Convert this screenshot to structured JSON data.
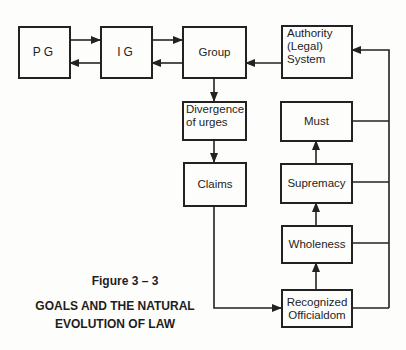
{
  "figure": {
    "label": "Figure 3 – 3",
    "title_line1": "GOALS AND THE NATURAL",
    "title_line2": "EVOLUTION OF LAW"
  },
  "nodes": {
    "pg": "PG",
    "ig": "IG",
    "group": "Group",
    "authority": [
      "Authority",
      "(Legal)",
      "System"
    ],
    "divergence": [
      "Divergence",
      "of urges"
    ],
    "claims": "Claims",
    "must": "Must",
    "supremacy": "Supremacy",
    "wholeness": "Wholeness",
    "recognized": [
      "Recognized",
      "Officialdom"
    ]
  },
  "edges": [
    {
      "from": "PG",
      "to": "IG"
    },
    {
      "from": "IG",
      "to": "PG"
    },
    {
      "from": "IG",
      "to": "Group"
    },
    {
      "from": "Group",
      "to": "IG"
    },
    {
      "from": "Authority (Legal) System",
      "to": "Group"
    },
    {
      "from": "Group",
      "to": "Divergence of urges"
    },
    {
      "from": "Divergence of urges",
      "to": "Claims"
    },
    {
      "from": "Claims",
      "to": "Recognized Officialdom"
    },
    {
      "from": "Recognized Officialdom",
      "to": "Wholeness"
    },
    {
      "from": "Wholeness",
      "to": "Supremacy"
    },
    {
      "from": "Supremacy",
      "to": "Must"
    },
    {
      "from": "Must",
      "to": "Authority (Legal) System"
    },
    {
      "from": "Supremacy",
      "to": "Authority (Legal) System"
    },
    {
      "from": "Wholeness",
      "to": "Authority (Legal) System"
    },
    {
      "from": "Recognized Officialdom",
      "to": "Authority (Legal) System"
    }
  ]
}
